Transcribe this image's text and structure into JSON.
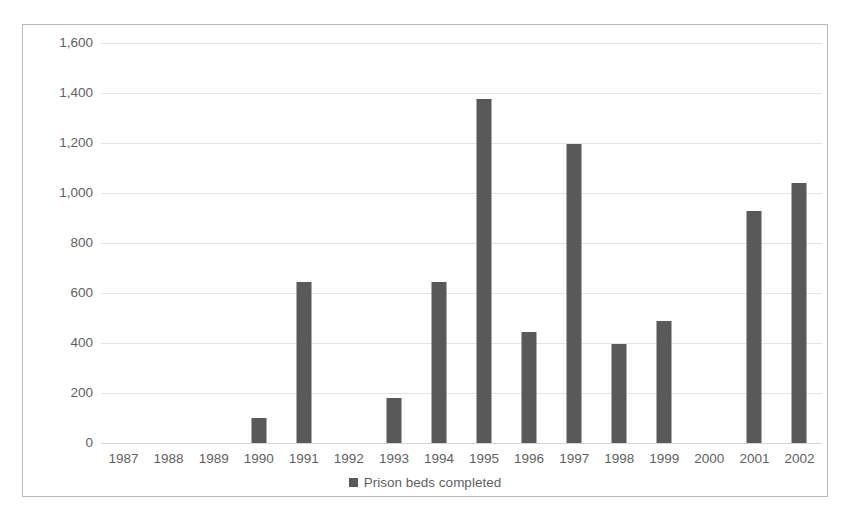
{
  "chart_data": {
    "type": "bar",
    "title": "",
    "subtitle": "",
    "xlabel": "",
    "ylabel": "",
    "categories": [
      "1987",
      "1988",
      "1989",
      "1990",
      "1991",
      "1992",
      "1993",
      "1994",
      "1995",
      "1996",
      "1997",
      "1998",
      "1999",
      "2000",
      "2001",
      "2002"
    ],
    "series": [
      {
        "name": "Prison beds completed",
        "values": [
          0,
          0,
          0,
          100,
          645,
          0,
          180,
          645,
          1375,
          445,
          1195,
          395,
          490,
          0,
          930,
          1040
        ]
      }
    ],
    "ylim": [
      0,
      1600
    ],
    "ytick_values": [
      0,
      200,
      400,
      600,
      800,
      1000,
      1200,
      1400,
      1600
    ],
    "ytick_labels": [
      "0",
      "200",
      "400",
      "600",
      "800",
      "1,000",
      "1,200",
      "1,400",
      "1,600"
    ],
    "grid": true,
    "grid_axis": "y",
    "legend": {
      "position": "bottom",
      "entries": [
        {
          "label": "Prison beds completed",
          "color": "#595959",
          "marker": "square"
        }
      ]
    },
    "colors": {
      "bar": "#595959",
      "gridline": "#e4e4e4",
      "axis_text": "#5f5f5f",
      "frame_border": "#b9b9b9",
      "background": "#ffffff"
    }
  }
}
